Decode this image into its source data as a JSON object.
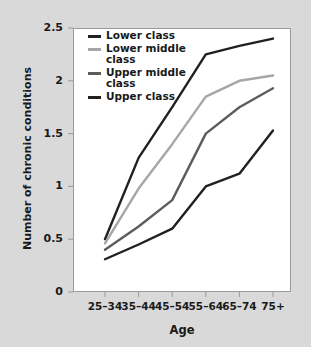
{
  "chart_data": {
    "type": "line",
    "title": "",
    "xlabel": "Age",
    "ylabel": "Number of chronic conditions",
    "categories": [
      "25–34",
      "35–44",
      "45–54",
      "55–64",
      "65–74",
      "75+"
    ],
    "ylim": [
      0,
      2.5
    ],
    "yticks": [
      "0",
      "0.5",
      "1",
      "1.5",
      "2",
      "2.5"
    ],
    "ytick_values": [
      0,
      0.5,
      1,
      1.5,
      2,
      2.5
    ],
    "grid": false,
    "legend_position": "top-left-inside",
    "series": [
      {
        "name": "Lower class",
        "color": "#231f20",
        "values": [
          0.5,
          1.27,
          1.75,
          2.25,
          2.33,
          2.4
        ]
      },
      {
        "name": "Lower middle class",
        "color": "#a6a6a6",
        "values": [
          0.46,
          0.98,
          1.4,
          1.85,
          2.0,
          2.05
        ]
      },
      {
        "name": "Upper middle class",
        "color": "#5c5c5c",
        "values": [
          0.4,
          0.62,
          0.87,
          1.5,
          1.75,
          1.93
        ]
      },
      {
        "name": "Upper class",
        "color": "#231f20",
        "values": [
          0.31,
          0.45,
          0.6,
          1.0,
          1.12,
          1.53
        ]
      }
    ]
  },
  "figure": {
    "background_color": "#d9d9d9",
    "plot_background_color": "#ffffff",
    "axis_color": "#9a9a9a"
  },
  "legend": {
    "items": [
      {
        "label": "Lower class"
      },
      {
        "label": "Lower middle class"
      },
      {
        "label": "Upper middle class"
      },
      {
        "label": "Upper class"
      }
    ]
  }
}
